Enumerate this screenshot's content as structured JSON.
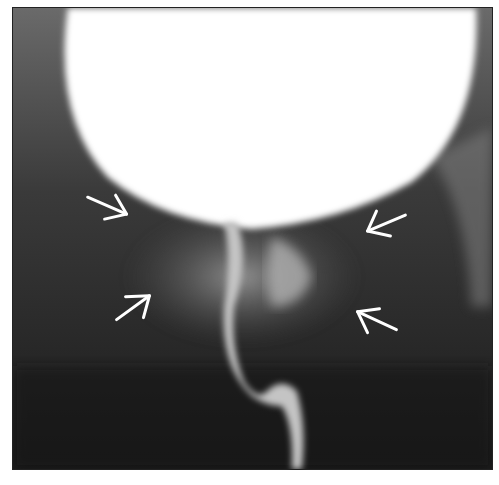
{
  "figure": {
    "type": "radiograph",
    "background": "#2a2a2a",
    "bright_region_color": "#ffffff",
    "arrow_color": "#ffffff",
    "arrows": [
      {
        "id": "upper-left",
        "direction": "down-right"
      },
      {
        "id": "lower-left",
        "direction": "up-right"
      },
      {
        "id": "upper-right",
        "direction": "down-left"
      },
      {
        "id": "lower-right",
        "direction": "up-left"
      }
    ]
  }
}
